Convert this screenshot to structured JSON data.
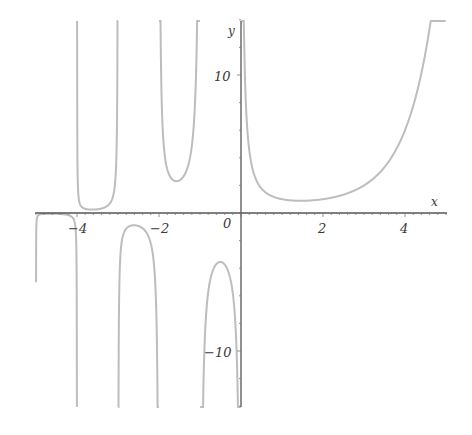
{
  "chart_data": {
    "type": "line",
    "title": "",
    "function": "Gamma(x)",
    "xlabel": "x",
    "ylabel": "y",
    "xlim": [
      -5,
      5
    ],
    "ylim": [
      -14,
      14
    ],
    "grid": false,
    "legend": null,
    "x_ticks": [
      -4,
      -2,
      0,
      2,
      4
    ],
    "x_tick_labels": [
      "-4",
      "-2",
      "0",
      "2",
      "4"
    ],
    "y_ticks": [
      10,
      -10
    ],
    "y_tick_labels": [
      "10",
      "−10"
    ],
    "asymptotes_x": [
      0,
      -1,
      -2,
      -3,
      -4,
      -5
    ],
    "series": [
      {
        "name": "Gamma(x)",
        "color": "#bdbdbd",
        "points": [
          {
            "x": 0.1,
            "y": 9.51
          },
          {
            "x": 0.25,
            "y": 3.63
          },
          {
            "x": 0.5,
            "y": 1.77
          },
          {
            "x": 1.0,
            "y": 1.0
          },
          {
            "x": 1.46,
            "y": 0.886
          },
          {
            "x": 2.0,
            "y": 1.0
          },
          {
            "x": 3.0,
            "y": 2.0
          },
          {
            "x": 4.0,
            "y": 6.0
          },
          {
            "x": 4.5,
            "y": 11.63
          },
          {
            "x": -0.5,
            "y": -3.545
          },
          {
            "x": -1.5,
            "y": 2.363
          },
          {
            "x": -2.5,
            "y": -0.945
          },
          {
            "x": -3.5,
            "y": 0.27
          },
          {
            "x": -4.5,
            "y": -0.06
          }
        ]
      }
    ]
  },
  "axes": {
    "x_label": "x",
    "y_label": "y",
    "origin_label": "0",
    "x_tick_labels": [
      "−4",
      "−2",
      "2",
      "4"
    ],
    "y_tick_labels": [
      "10",
      "−10"
    ]
  },
  "colors": {
    "curve": "#bdbdbd",
    "axis": "#555555",
    "background": "#ffffff"
  }
}
